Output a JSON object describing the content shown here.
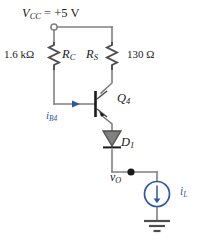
{
  "figure": {
    "kind": "schematic-diagram",
    "background_color": "#ffffff",
    "wire_color": "#808080",
    "device_color": "#4d4d4d",
    "accent_color": "#2c56a8",
    "text_color": "#1a1a1a",
    "equals_color": "#8a3b2e"
  },
  "labels": {
    "supply_name": "V",
    "supply_sub": "CC",
    "supply_equals": " = ",
    "supply_value": "+5 V",
    "rc_value": "1.6 kΩ",
    "rc_name": "R",
    "rc_sub": "C",
    "rs_name": "R",
    "rs_sub": "S",
    "rs_value": "130 Ω",
    "transistor_name": "Q",
    "transistor_sub": "4",
    "base_current_name": "i",
    "base_current_sub": "B4",
    "diode_name": "D",
    "diode_sub": "1",
    "output_name": "v",
    "output_sub": "O",
    "load_current_name": "i",
    "load_current_sub": "L"
  },
  "components": {
    "supply_terminal": "open-circle-terminal",
    "resistor_rc": "resistor-zigzag",
    "resistor_rs": "resistor-zigzag",
    "transistor_q4": "npn-bjt",
    "diode_d1": "diode",
    "node_vo": "junction-dot",
    "current_source_il": "current-source-circle",
    "ground": "earth-ground"
  }
}
